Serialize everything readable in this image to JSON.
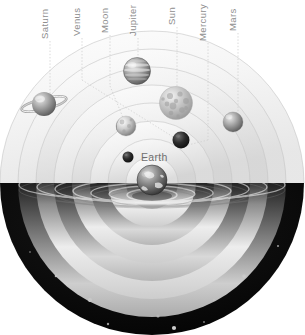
{
  "figure": {
    "background_color": "#ffffff",
    "label_color": "#8e8e8e",
    "earth_label_color": "#6f6f6f",
    "leader_line_color": "#cfcfcf",
    "dome_color": "#090909",
    "star_color": "#ffffff"
  },
  "callouts": [
    {
      "id": "saturn",
      "label": "Saturn",
      "x": 50,
      "text_bottom": 39,
      "line_from": 41,
      "line_to": 103
    },
    {
      "id": "venus",
      "label": "Venus",
      "x": 82,
      "text_bottom": 36,
      "line_from": 38,
      "line_to": 118
    },
    {
      "id": "moon",
      "label": "Moon",
      "x": 110,
      "text_bottom": 33,
      "line_from": 35,
      "line_to": 120
    },
    {
      "id": "jupiter",
      "label": "Jupiter",
      "x": 138,
      "text_bottom": 36,
      "line_from": 38,
      "line_to": 58
    },
    {
      "id": "sun",
      "label": "Sun",
      "x": 177,
      "text_bottom": 25,
      "line_from": 27,
      "line_to": 88
    },
    {
      "id": "mercury",
      "label": "Mercury",
      "x": 208,
      "text_bottom": 41,
      "line_from": 43,
      "line_to": 140
    },
    {
      "id": "mars",
      "label": "Mars",
      "x": 238,
      "text_bottom": 31,
      "line_from": 33,
      "line_to": 118
    }
  ],
  "earth_label": {
    "label": "Earth",
    "x": 141,
    "y": 151
  },
  "bodies": [
    {
      "id": "saturn",
      "name": "Saturn",
      "cx": 44,
      "cy": 104,
      "r": 12,
      "kind": "ringed",
      "tone": "#b9b9b9"
    },
    {
      "id": "jupiter",
      "name": "Jupiter",
      "cx": 137,
      "cy": 71,
      "r": 13.5,
      "kind": "banded",
      "tone": "#8f8f8f"
    },
    {
      "id": "sun",
      "name": "Sun",
      "cx": 176,
      "cy": 103,
      "r": 16.5,
      "kind": "mottled",
      "tone": "#c9c9c9"
    },
    {
      "id": "mars",
      "name": "Mars",
      "cx": 233,
      "cy": 122,
      "r": 10,
      "kind": "plain",
      "tone": "#a9a9a9"
    },
    {
      "id": "moon",
      "name": "Moon",
      "cx": 126,
      "cy": 126,
      "r": 10,
      "kind": "cratered",
      "tone": "#cfcfcf"
    },
    {
      "id": "venus",
      "name": "Venus",
      "cx": 181,
      "cy": 140,
      "r": 8.5,
      "kind": "dark",
      "tone": "#262626"
    },
    {
      "id": "mercury",
      "name": "Mercury",
      "cx": 128,
      "cy": 157,
      "r": 5.5,
      "kind": "dark",
      "tone": "#3a3a3a"
    },
    {
      "id": "earth",
      "name": "Earth",
      "cx": 152,
      "cy": 180,
      "r": 15,
      "kind": "earth",
      "tone": "#5d5d5d"
    }
  ],
  "orbit_shells": {
    "count": 8,
    "center_x": 152,
    "center_y": 183,
    "radii": [
      26,
      44,
      62,
      80,
      98,
      116,
      134,
      152
    ],
    "tone_light": "#f4f4f4",
    "tone_mid": "#e3e3e3",
    "tone_dark": "#b5b5b5"
  },
  "dome": {
    "center_x": 152,
    "center_y": 183,
    "radius": 152,
    "cut_y": 183
  }
}
